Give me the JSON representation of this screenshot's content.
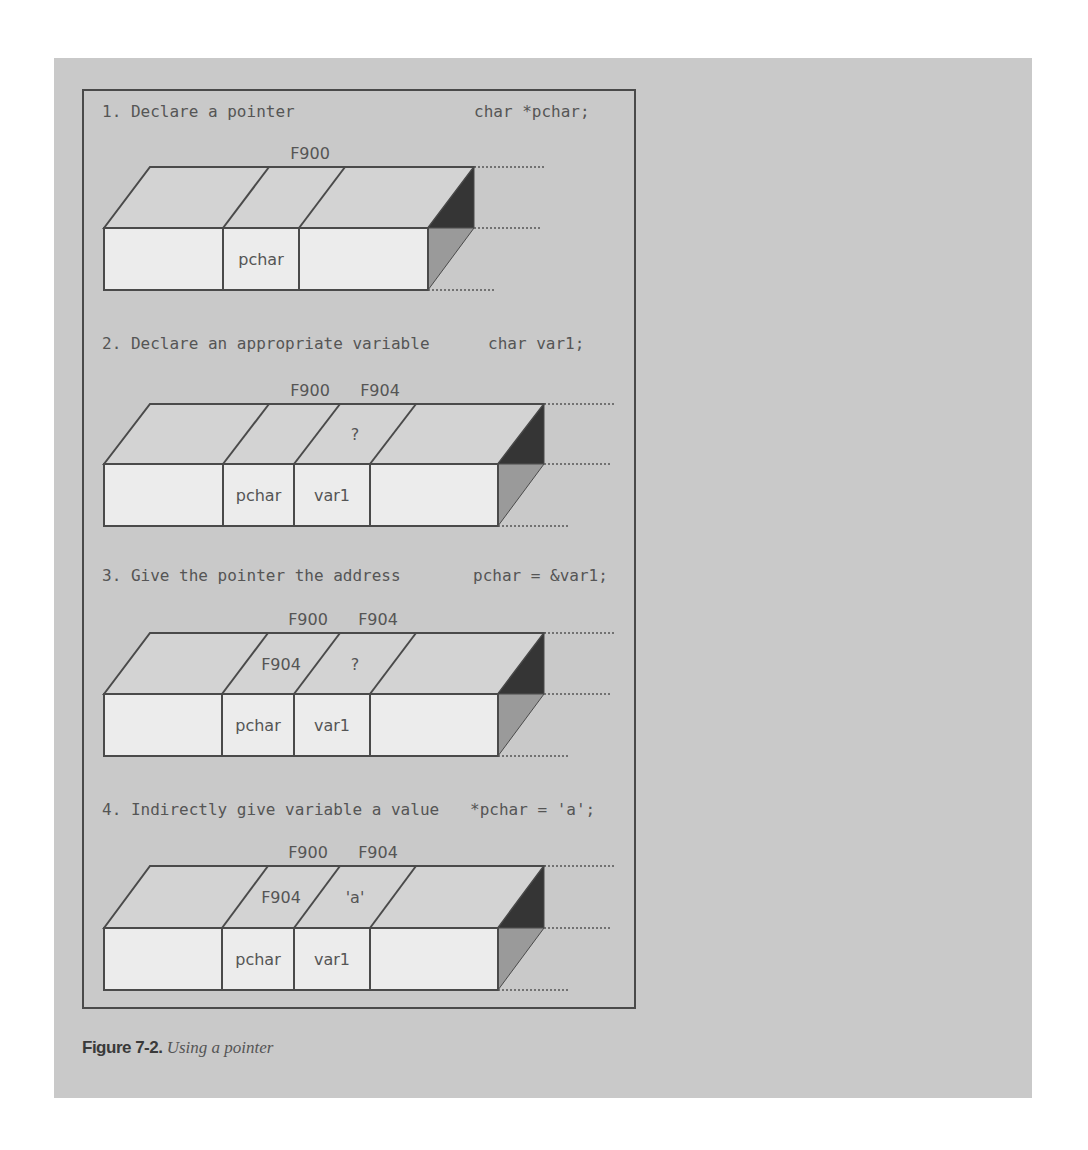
{
  "figure": {
    "caption_label": "Figure 7-2.",
    "caption_text": " Using a pointer"
  },
  "steps": [
    {
      "title": "1. Declare a pointer",
      "code": "char *pchar;",
      "addresses": [
        "F900"
      ],
      "cells": [
        "",
        "pchar",
        ""
      ],
      "top_values": [
        "",
        "",
        ""
      ]
    },
    {
      "title": "2. Declare an appropriate variable",
      "code": "char var1;",
      "addresses": [
        "F900",
        "F904"
      ],
      "cells": [
        "",
        "pchar",
        "var1",
        ""
      ],
      "top_values": [
        "",
        "",
        "?",
        ""
      ]
    },
    {
      "title": "3. Give the pointer the address",
      "code": "pchar = &var1;",
      "addresses": [
        "F900",
        "F904"
      ],
      "cells": [
        "",
        "pchar",
        "var1",
        ""
      ],
      "top_values": [
        "",
        "F904",
        "?",
        ""
      ]
    },
    {
      "title": "4. Indirectly give variable a value",
      "code": "*pchar = 'a';",
      "addresses": [
        "F900",
        "F904"
      ],
      "cells": [
        "",
        "pchar",
        "var1",
        ""
      ],
      "top_values": [
        "",
        "F904",
        "'a'",
        ""
      ]
    }
  ],
  "colors": {
    "panel": "#c9c9c9",
    "top_face": "#d3d3d3",
    "front_face": "#ececec",
    "dark_side": "#353535",
    "mid_side": "#9a9a9a",
    "line": "#4a4a4a"
  }
}
